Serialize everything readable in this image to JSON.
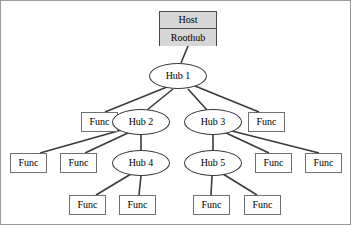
{
  "diagram": {
    "type": "tree-diagram",
    "canvas": {
      "width": 351,
      "height": 225
    },
    "colors": {
      "host_fill": "#d6d6d6",
      "node_fill": "#ffffff",
      "stroke": "#3a3a3a",
      "box_stroke": "#6f6f6f",
      "frame": "#9a9a9a",
      "text": "#000000"
    },
    "root": {
      "id": "host",
      "shape": "rect-stack",
      "labels": [
        "Host",
        "Roothub"
      ],
      "x": 158,
      "y": 10,
      "w": 58,
      "h": 35
    },
    "nodes": [
      {
        "id": "hub1",
        "shape": "ellipse",
        "label": "Hub 1",
        "cx": 177,
        "cy": 75,
        "rx": 29,
        "ry": 13
      },
      {
        "id": "func_r2_l",
        "shape": "rect",
        "label": "Func",
        "x": 80,
        "y": 111,
        "w": 37,
        "h": 20
      },
      {
        "id": "hub2",
        "shape": "ellipse",
        "label": "Hub 2",
        "cx": 140,
        "cy": 121,
        "rx": 29,
        "ry": 13
      },
      {
        "id": "hub3",
        "shape": "ellipse",
        "label": "Hub 3",
        "cx": 212,
        "cy": 121,
        "rx": 29,
        "ry": 13
      },
      {
        "id": "func_r2_r",
        "shape": "rect",
        "label": "Func",
        "x": 247,
        "y": 111,
        "w": 37,
        "h": 20
      },
      {
        "id": "func_r3_a",
        "shape": "rect",
        "label": "Func",
        "x": 9,
        "y": 152,
        "w": 37,
        "h": 20
      },
      {
        "id": "func_r3_b",
        "shape": "rect",
        "label": "Func",
        "x": 59,
        "y": 152,
        "w": 37,
        "h": 20
      },
      {
        "id": "hub4",
        "shape": "ellipse",
        "label": "Hub 4",
        "cx": 140,
        "cy": 162,
        "rx": 29,
        "ry": 13
      },
      {
        "id": "hub5",
        "shape": "ellipse",
        "label": "Hub 5",
        "cx": 212,
        "cy": 162,
        "rx": 29,
        "ry": 13
      },
      {
        "id": "func_r3_c",
        "shape": "rect",
        "label": "Func",
        "x": 254,
        "y": 152,
        "w": 37,
        "h": 20
      },
      {
        "id": "func_r3_d",
        "shape": "rect",
        "label": "Func",
        "x": 304,
        "y": 152,
        "w": 37,
        "h": 20
      },
      {
        "id": "func_r4_a",
        "shape": "rect",
        "label": "Func",
        "x": 68,
        "y": 194,
        "w": 37,
        "h": 20
      },
      {
        "id": "func_r4_b",
        "shape": "rect",
        "label": "Func",
        "x": 118,
        "y": 194,
        "w": 37,
        "h": 20
      },
      {
        "id": "func_r4_c",
        "shape": "rect",
        "label": "Func",
        "x": 192,
        "y": 194,
        "w": 37,
        "h": 20
      },
      {
        "id": "func_r4_d",
        "shape": "rect",
        "label": "Func",
        "x": 243,
        "y": 194,
        "w": 37,
        "h": 20
      }
    ],
    "edges": [
      {
        "from": "host",
        "to": "hub1",
        "x1": 187,
        "y1": 45,
        "x2": 180,
        "y2": 62
      },
      {
        "from": "hub1",
        "to": "func_r2_l",
        "x1": 166,
        "y1": 86,
        "x2": 104,
        "y2": 111
      },
      {
        "from": "hub1",
        "to": "hub2",
        "x1": 172,
        "y1": 88,
        "x2": 146,
        "y2": 109
      },
      {
        "from": "hub1",
        "to": "hub3",
        "x1": 187,
        "y1": 88,
        "x2": 206,
        "y2": 109
      },
      {
        "from": "hub1",
        "to": "func_r2_r",
        "x1": 194,
        "y1": 85,
        "x2": 258,
        "y2": 111
      },
      {
        "from": "hub2",
        "to": "func_r3_a",
        "x1": 124,
        "y1": 128,
        "x2": 39,
        "y2": 152
      },
      {
        "from": "hub2",
        "to": "func_r3_b",
        "x1": 129,
        "y1": 131,
        "x2": 84,
        "y2": 152
      },
      {
        "from": "hub2",
        "to": "hub4",
        "x1": 140,
        "y1": 134,
        "x2": 140,
        "y2": 149
      },
      {
        "from": "hub3",
        "to": "hub5",
        "x1": 212,
        "y1": 134,
        "x2": 212,
        "y2": 149
      },
      {
        "from": "hub3",
        "to": "func_r3_c",
        "x1": 223,
        "y1": 131,
        "x2": 268,
        "y2": 152
      },
      {
        "from": "hub3",
        "to": "func_r3_d",
        "x1": 227,
        "y1": 129,
        "x2": 318,
        "y2": 152
      },
      {
        "from": "hub4",
        "to": "func_r4_a",
        "x1": 130,
        "y1": 173,
        "x2": 95,
        "y2": 194
      },
      {
        "from": "hub4",
        "to": "func_r4_b",
        "x1": 140,
        "y1": 175,
        "x2": 138,
        "y2": 194
      },
      {
        "from": "hub5",
        "to": "func_r4_c",
        "x1": 211,
        "y1": 175,
        "x2": 210,
        "y2": 194
      },
      {
        "from": "hub5",
        "to": "func_r4_d",
        "x1": 222,
        "y1": 173,
        "x2": 256,
        "y2": 194
      }
    ]
  }
}
